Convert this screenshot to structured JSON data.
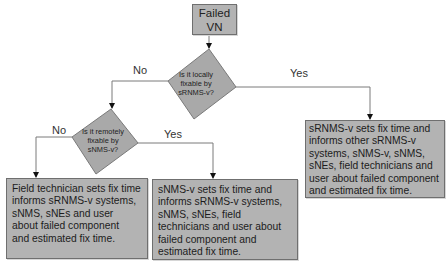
{
  "diagram": {
    "type": "flowchart",
    "start": {
      "label_line1": "Failed",
      "label_line2": "VN"
    },
    "decision1": {
      "lines": [
        "Is it locally",
        "fixable by",
        "sRNMS-v?"
      ],
      "no_label": "No",
      "yes_label": "Yes"
    },
    "decision2": {
      "lines": [
        "Is it remotely",
        "fixable by",
        "sNMS-v?"
      ],
      "no_label": "No",
      "yes_label": "Yes"
    },
    "outcome_local": {
      "lines": [
        "sRNMS-v sets fix time and",
        "informs other sRNMS-v",
        "systems, sNMS-v, sNMS,",
        "sNEs, field technicians and",
        "user about failed component",
        "and estimated fix time."
      ]
    },
    "outcome_remote": {
      "lines": [
        "sNMS-v sets fix time and",
        "informs sRNMS-v systems,",
        "sNMS, sNEs, field",
        "technicians and user about",
        "failed component and",
        "estimated fix time."
      ]
    },
    "outcome_field": {
      "lines": [
        "Field technician sets fix time",
        "informs sRNMS-v systems,",
        "sNMS, sNEs and user",
        "about failed component",
        "and estimated fix time."
      ]
    },
    "colors": {
      "box_fill": "#b3b3b3",
      "box_border": "#6f6f6f",
      "diamond_fill": "#a9a9a9",
      "connector": "#7a7a7a",
      "arrowhead": "#111111"
    }
  }
}
